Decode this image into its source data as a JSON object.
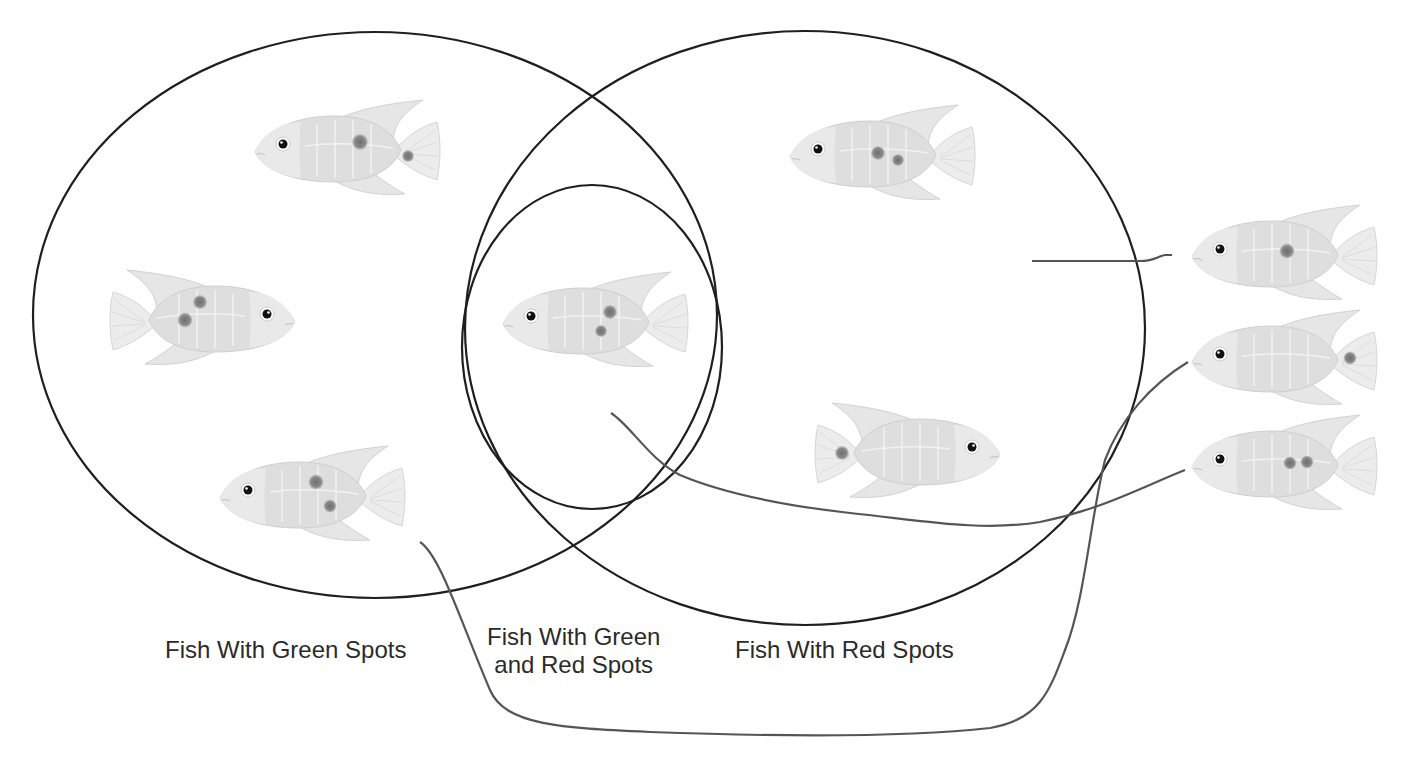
{
  "diagram": {
    "type": "venn",
    "sets": [
      {
        "id": "green",
        "label": "Fish With Green Spots"
      },
      {
        "id": "both",
        "label_line1": "Fish With Green",
        "label_line2": "and Red Spots"
      },
      {
        "id": "red",
        "label": "Fish With Red Spots"
      }
    ],
    "fish": [
      {
        "region": "green",
        "facing": "left",
        "spots": 2,
        "spot_positions": [
          "body",
          "tail"
        ]
      },
      {
        "region": "green",
        "facing": "right",
        "spots": 2,
        "spot_positions": [
          "body",
          "body"
        ]
      },
      {
        "region": "green",
        "facing": "left",
        "spots": 2,
        "spot_positions": [
          "body",
          "body"
        ]
      },
      {
        "region": "both",
        "facing": "left",
        "spots": 2,
        "spot_positions": [
          "body",
          "body"
        ]
      },
      {
        "region": "red",
        "facing": "left",
        "spots": 2,
        "spot_positions": [
          "body",
          "body"
        ]
      },
      {
        "region": "red",
        "facing": "right",
        "spots": 1,
        "spot_positions": [
          "tail"
        ]
      }
    ],
    "loose_fish": [
      {
        "id": "A",
        "spots": 1,
        "spot_positions": [
          "body"
        ],
        "connected_to": "red"
      },
      {
        "id": "B",
        "spots": 1,
        "spot_positions": [
          "tail"
        ],
        "connected_to": "green"
      },
      {
        "id": "C",
        "spots": 2,
        "spot_positions": [
          "body",
          "body"
        ],
        "connected_to": "both"
      }
    ],
    "colors": {
      "outline": "#1f1f1f",
      "connector": "#555555",
      "fish_body": "#dcdcdc",
      "fish_fin": "#e8e8e8",
      "spot": "#7a7a7a",
      "label": "#2b2b2b"
    }
  }
}
